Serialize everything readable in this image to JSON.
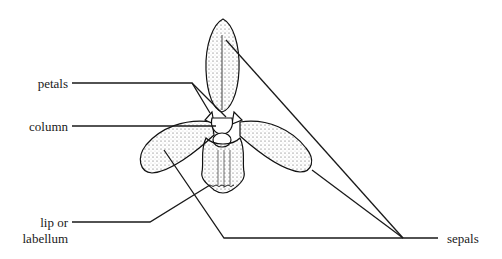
{
  "diagram": {
    "labels": {
      "petals": "petals",
      "column": "column",
      "lip_line1": "lip or",
      "lip_line2": "labellum",
      "sepals": "sepals"
    },
    "colors": {
      "ink": "#1a1a1a",
      "background": "#ffffff"
    }
  }
}
